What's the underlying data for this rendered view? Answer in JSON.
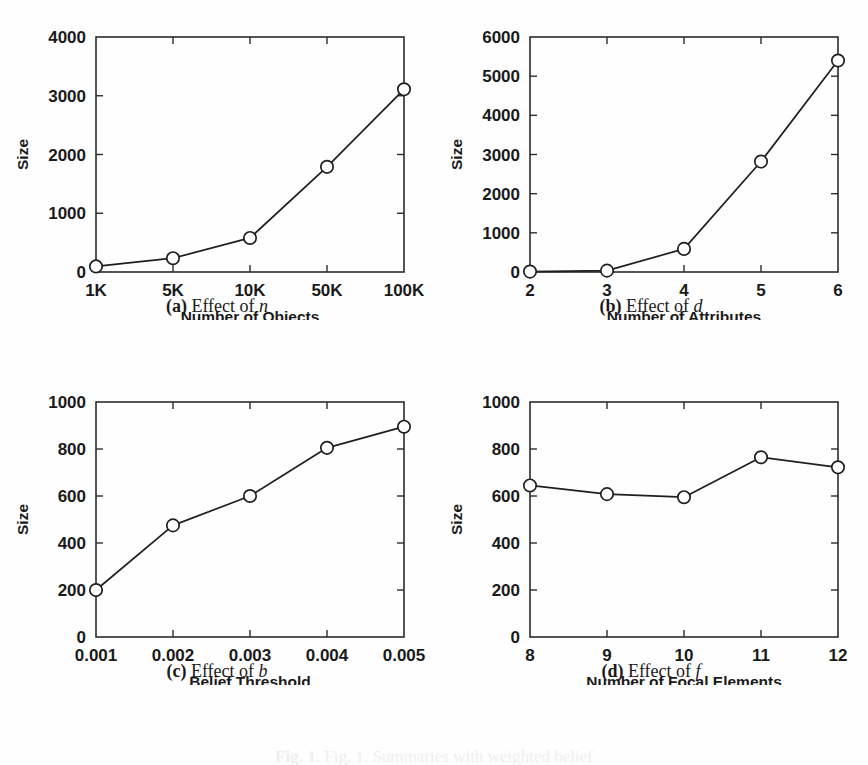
{
  "figure": {
    "caption": "Fig. 1. Summaries with weighted belief",
    "caption_tag": "Fig. 1."
  },
  "panels": [
    {
      "id": "a",
      "caption_tag": "(a)",
      "caption_text": "Effect of",
      "caption_var": "n",
      "chart_data": {
        "type": "line",
        "title": "",
        "xlabel": "Number of Objects",
        "ylabel": "Size",
        "categories": [
          "1K",
          "5K",
          "10K",
          "50K",
          "100K"
        ],
        "values": [
          95,
          235,
          580,
          1790,
          3110
        ],
        "ytick_labels": [
          "0",
          "1000",
          "2000",
          "3000",
          "4000"
        ],
        "ytick_values": [
          0,
          1000,
          2000,
          3000,
          4000
        ],
        "ylim": [
          0,
          4000
        ],
        "grid": false,
        "legend": "none",
        "marker": "circle-open"
      }
    },
    {
      "id": "b",
      "caption_tag": "(b)",
      "caption_text": "Effect of",
      "caption_var": "d",
      "chart_data": {
        "type": "line",
        "title": "",
        "xlabel": "Number of Attributes",
        "ylabel": "Size",
        "categories": [
          "2",
          "3",
          "4",
          "5",
          "6"
        ],
        "values": [
          10,
          35,
          590,
          2820,
          5400
        ],
        "ytick_labels": [
          "0",
          "1000",
          "2000",
          "3000",
          "4000",
          "5000",
          "6000"
        ],
        "ytick_values": [
          0,
          1000,
          2000,
          3000,
          4000,
          5000,
          6000
        ],
        "ylim": [
          0,
          6000
        ],
        "grid": false,
        "legend": "none",
        "marker": "circle-open"
      }
    },
    {
      "id": "c",
      "caption_tag": "(c)",
      "caption_text": "Effect of",
      "caption_var": "b",
      "chart_data": {
        "type": "line",
        "title": "",
        "xlabel": "Belief Threshold",
        "ylabel": "Size",
        "categories": [
          "0.001",
          "0.002",
          "0.003",
          "0.004",
          "0.005"
        ],
        "values": [
          200,
          475,
          600,
          805,
          895
        ],
        "ytick_labels": [
          "0",
          "200",
          "400",
          "600",
          "800",
          "1000"
        ],
        "ytick_values": [
          0,
          200,
          400,
          600,
          800,
          1000
        ],
        "ylim": [
          0,
          1000
        ],
        "grid": false,
        "legend": "none",
        "marker": "circle-open"
      }
    },
    {
      "id": "d",
      "caption_tag": "(d)",
      "caption_text": "Effect of",
      "caption_var": "f",
      "chart_data": {
        "type": "line",
        "title": "",
        "xlabel": "Number of Focal Elements",
        "ylabel": "Size",
        "categories": [
          "8",
          "9",
          "10",
          "11",
          "12"
        ],
        "values": [
          645,
          608,
          595,
          765,
          722
        ],
        "ytick_labels": [
          "0",
          "200",
          "400",
          "600",
          "800",
          "1000"
        ],
        "ytick_values": [
          0,
          200,
          400,
          600,
          800,
          1000
        ],
        "ylim": [
          0,
          1000
        ],
        "grid": false,
        "legend": "none",
        "marker": "circle-open"
      }
    }
  ]
}
